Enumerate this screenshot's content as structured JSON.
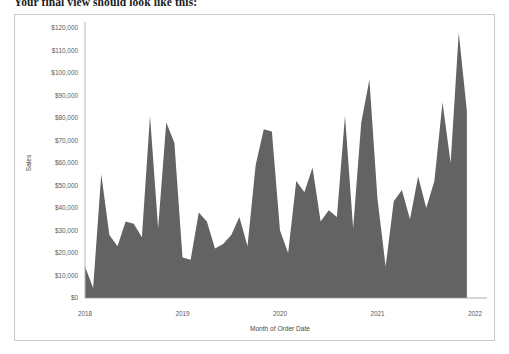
{
  "intro": {
    "text": "Your final view should look like this:"
  },
  "colors": {
    "area_fill": "#636363",
    "frame_border": "#c9c9c9",
    "axis_line": "#b5b5b5",
    "zero_line": "#9a9a9a",
    "tick_text": "#5a5a5a",
    "background": "#ffffff"
  },
  "chart_data": {
    "type": "area",
    "title": "",
    "subtitle": "",
    "xlabel": "Month of Order Date",
    "ylabel": "Sales",
    "grid": false,
    "legend": null,
    "legend_position": "none",
    "ylim": [
      0,
      120000
    ],
    "y_ticks": [
      0,
      10000,
      20000,
      30000,
      40000,
      50000,
      60000,
      70000,
      80000,
      90000,
      100000,
      110000,
      120000
    ],
    "y_tick_labels": [
      "$0",
      "$10,000",
      "$20,000",
      "$30,000",
      "$40,000",
      "$50,000",
      "$60,000",
      "$70,000",
      "$80,000",
      "$90,000",
      "$100,000",
      "$110,000",
      "$120,000"
    ],
    "x_tick_labels": [
      "2018",
      "2019",
      "2020",
      "2021",
      "2022"
    ],
    "x_tick_values": [
      "2018-01",
      "2019-01",
      "2020-01",
      "2021-01",
      "2022-01"
    ],
    "xlim": [
      "2018-01",
      "2022-01"
    ],
    "categories": [
      "2018-01",
      "2018-02",
      "2018-03",
      "2018-04",
      "2018-05",
      "2018-06",
      "2018-07",
      "2018-08",
      "2018-09",
      "2018-10",
      "2018-11",
      "2018-12",
      "2019-01",
      "2019-02",
      "2019-03",
      "2019-04",
      "2019-05",
      "2019-06",
      "2019-07",
      "2019-08",
      "2019-09",
      "2019-10",
      "2019-11",
      "2019-12",
      "2020-01",
      "2020-02",
      "2020-03",
      "2020-04",
      "2020-05",
      "2020-06",
      "2020-07",
      "2020-08",
      "2020-09",
      "2020-10",
      "2020-11",
      "2020-12",
      "2021-01",
      "2021-02",
      "2021-03",
      "2021-04",
      "2021-05",
      "2021-06",
      "2021-07",
      "2021-08",
      "2021-09",
      "2021-10",
      "2021-11",
      "2021-12"
    ],
    "values": [
      14000,
      4500,
      55000,
      28000,
      23000,
      34000,
      33000,
      27000,
      81000,
      31000,
      78000,
      69000,
      18000,
      17000,
      38000,
      34000,
      22000,
      24000,
      28000,
      36000,
      23000,
      59000,
      75000,
      74000,
      30000,
      20000,
      52000,
      47000,
      58000,
      34000,
      39000,
      36000,
      81000,
      31000,
      78000,
      97000,
      44000,
      14000,
      43000,
      48000,
      35000,
      54000,
      40000,
      52000,
      87000,
      60000,
      118000,
      83000
    ],
    "series_name": "Sales",
    "n_points": 48,
    "max_value": 118000,
    "min_value": 4500
  }
}
